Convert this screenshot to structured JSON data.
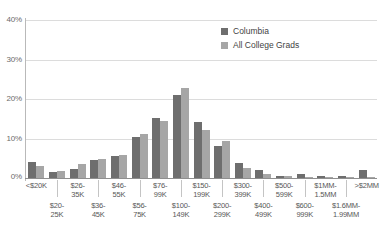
{
  "chart_data": {
    "type": "bar",
    "title": "",
    "subtitle": "",
    "xlabel": "",
    "ylabel": "",
    "ylim": [
      0,
      40
    ],
    "grid": true,
    "legend_position": "top-right",
    "y_ticks": [
      "0%",
      "10%",
      "20%",
      "30%",
      "40%"
    ],
    "y_tick_values": [
      0,
      10,
      20,
      30,
      40
    ],
    "categories": [
      "<$20K",
      "$20-25K",
      "$26-35K",
      "$36-45K",
      "$46-55K",
      "$56-75K",
      "$76-99K",
      "$100-149K",
      "$150-199K",
      "$200-299K",
      "$300-399K",
      "$400-499K",
      "$500-599K",
      "$600-999K",
      "$1MM-1.5MM",
      "$1.6MM-1.99MM",
      ">$2MM"
    ],
    "category_lines": [
      [
        "<$20K"
      ],
      [
        "$20-",
        "25K"
      ],
      [
        "$26-",
        "35K"
      ],
      [
        "$36-",
        "45K"
      ],
      [
        "$46-",
        "55K"
      ],
      [
        "$56-",
        "75K"
      ],
      [
        "$76-",
        "99K"
      ],
      [
        "$100-",
        "149K"
      ],
      [
        "$150-",
        "199K"
      ],
      [
        "$200-",
        "299K"
      ],
      [
        "$300-",
        "399K"
      ],
      [
        "$400-",
        "499K"
      ],
      [
        "$500-",
        "599K"
      ],
      [
        "$600-",
        "999K"
      ],
      [
        "$1MM-",
        "1.5MM"
      ],
      [
        "$1.6MM-",
        "1.99MM"
      ],
      [
        ">$2MM"
      ]
    ],
    "series": [
      {
        "name": "Columbia",
        "color": "#6e6e6e",
        "values": [
          3.9,
          1.4,
          2.2,
          4.6,
          5.4,
          10.3,
          14.9,
          20.7,
          14.1,
          8.0,
          3.7,
          2.1,
          0.5,
          1.1,
          0.4,
          0.5,
          1.9
        ]
      },
      {
        "name": "All College Grads",
        "color": "#a6a6a6",
        "values": [
          2.9,
          1.7,
          3.4,
          4.7,
          5.8,
          11.0,
          14.3,
          22.5,
          11.9,
          9.2,
          2.5,
          0.9,
          0.5,
          0.3,
          0.2,
          0.1,
          0.2
        ]
      }
    ]
  },
  "legend": {
    "items": [
      {
        "label": "Columbia",
        "color": "#6e6e6e"
      },
      {
        "label": "All College Grads",
        "color": "#a6a6a6"
      }
    ]
  },
  "colors": {
    "columbia": "#6e6e6e",
    "all_college_grads": "#a6a6a6",
    "gridline": "#dcdcdc",
    "axis": "#8f8f8f",
    "tick_text": "#6b6b6b",
    "label_text": "#585858",
    "background": "#ffffff"
  }
}
